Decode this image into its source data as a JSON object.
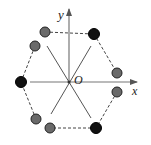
{
  "diagram": {
    "labels": {
      "y_axis": "y",
      "x_axis": "x",
      "origin": "O"
    },
    "colors": {
      "axis": "#777777",
      "line": "#555555",
      "dashed": "#444444",
      "black_dot": "#111111",
      "gray_dot": "#6a6a6a",
      "dot_stroke": "#222222"
    },
    "charges": {
      "black": [
        {
          "cx": 94,
          "cy": 34
        },
        {
          "cx": 21,
          "cy": 82
        },
        {
          "cx": 96,
          "cy": 128
        }
      ],
      "gray": [
        {
          "cx": 45,
          "cy": 32
        },
        {
          "cx": 35,
          "cy": 46
        },
        {
          "cx": 117,
          "cy": 73
        },
        {
          "cx": 117,
          "cy": 92
        },
        {
          "cx": 36,
          "cy": 119
        },
        {
          "cx": 50,
          "cy": 128
        }
      ]
    }
  }
}
